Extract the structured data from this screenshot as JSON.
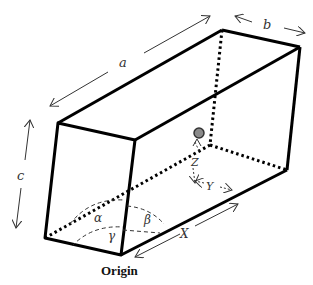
{
  "diagram": {
    "labels": {
      "a": "a",
      "b": "b",
      "c": "c",
      "alpha": "α",
      "beta": "β",
      "gamma": "γ",
      "X": "X",
      "Y": "Y",
      "Z": "Z",
      "origin": "Origin"
    },
    "colors": {
      "edge": "#000000",
      "arrow": "#333333",
      "atom_fill": "#8a8a8a",
      "atom_stroke": "#333333",
      "background": "#ffffff"
    },
    "vertices": {
      "top_front_left": [
        58,
        123
      ],
      "top_front_right": [
        135,
        140
      ],
      "top_back_left": [
        222,
        30
      ],
      "top_back_right": [
        300,
        47
      ],
      "bottom_front_left": [
        45,
        238
      ],
      "origin": [
        121,
        255
      ],
      "bottom_back_right": [
        287,
        170
      ],
      "bottom_back_left_hidden": [
        210,
        145
      ]
    },
    "atom": {
      "cx": 199,
      "cy": 133,
      "r": 5
    }
  }
}
